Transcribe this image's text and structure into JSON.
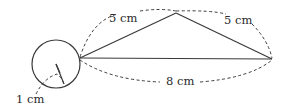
{
  "diagram": {
    "labels": {
      "side_left": "5 cm",
      "side_right": "5 cm",
      "base": "8 cm",
      "radius": "1 cm"
    },
    "shapes": {
      "circle": "circle-with-radius",
      "triangle": "isosceles-triangle"
    }
  }
}
